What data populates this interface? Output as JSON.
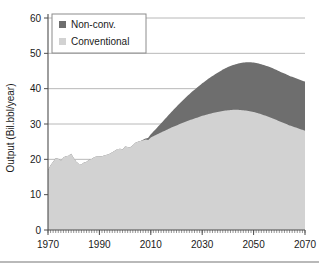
{
  "chart_data": {
    "type": "area",
    "stacked": true,
    "title": "",
    "xlabel": "",
    "ylabel": "Output (Bil.bbl/year)",
    "xlim": [
      1970,
      2070
    ],
    "ylim": [
      0,
      60
    ],
    "xticks": [
      1970,
      1990,
      2010,
      2030,
      2050,
      2070
    ],
    "yticks": [
      0,
      10,
      20,
      30,
      40,
      50,
      60
    ],
    "xtick_labels": [
      "1970",
      "1990",
      "2010",
      "2030",
      "2050",
      "2070"
    ],
    "ytick_labels": [
      "0",
      "10",
      "20",
      "30",
      "40",
      "50",
      "60"
    ],
    "minor_xtick_interval": 1,
    "grid": "horizontal",
    "legend_position": "top-left",
    "colors": {
      "non_conventional": "#6e6e6e",
      "conventional": "#d2d2d2",
      "axis": "#4d4d4d",
      "grid": "#b0b0b0",
      "text": "#1a1a1a",
      "legend_border": "#8c8c8c",
      "background": "#ffffff"
    },
    "series": [
      {
        "name": "Conventional",
        "color_key": "conventional",
        "x": [
          1970,
          1971,
          1972,
          1973,
          1974,
          1975,
          1976,
          1977,
          1978,
          1979,
          1980,
          1981,
          1982,
          1983,
          1984,
          1985,
          1986,
          1987,
          1988,
          1989,
          1990,
          1991,
          1992,
          1993,
          1994,
          1995,
          1996,
          1997,
          1998,
          1999,
          2000,
          2001,
          2002,
          2003,
          2004,
          2005,
          2006,
          2007,
          2008,
          2009,
          2010,
          2012,
          2014,
          2016,
          2018,
          2020,
          2022,
          2024,
          2026,
          2028,
          2030,
          2032,
          2034,
          2036,
          2038,
          2040,
          2042,
          2044,
          2046,
          2048,
          2050,
          2052,
          2054,
          2056,
          2058,
          2060,
          2062,
          2064,
          2066,
          2068,
          2070
        ],
        "values": [
          17.0,
          18.3,
          19.3,
          20.3,
          20.2,
          19.6,
          20.5,
          20.9,
          21.0,
          21.6,
          20.4,
          19.3,
          18.7,
          18.6,
          19.1,
          19.3,
          19.9,
          20.1,
          20.6,
          20.8,
          20.8,
          20.9,
          21.1,
          21.3,
          21.6,
          22.0,
          22.4,
          22.9,
          23.0,
          22.8,
          23.6,
          23.5,
          23.4,
          24.0,
          24.7,
          25.0,
          25.2,
          25.4,
          25.6,
          25.5,
          26.2,
          26.9,
          27.6,
          28.3,
          29.0,
          29.6,
          30.2,
          30.8,
          31.3,
          31.8,
          32.3,
          32.7,
          33.1,
          33.4,
          33.7,
          33.9,
          34.0,
          34.0,
          33.9,
          33.7,
          33.4,
          33.0,
          32.5,
          32.0,
          31.4,
          30.8,
          30.2,
          29.6,
          29.1,
          28.6,
          28.1
        ]
      },
      {
        "name": "Non-conv.",
        "color_key": "non_conventional",
        "x": [
          1970,
          2006,
          2008,
          2010,
          2012,
          2014,
          2016,
          2018,
          2020,
          2022,
          2024,
          2026,
          2028,
          2030,
          2032,
          2034,
          2036,
          2038,
          2040,
          2042,
          2044,
          2046,
          2048,
          2050,
          2052,
          2054,
          2056,
          2058,
          2060,
          2062,
          2064,
          2066,
          2068,
          2070
        ],
        "values": [
          0,
          0,
          0.3,
          0.9,
          1.7,
          2.6,
          3.5,
          4.4,
          5.3,
          6.2,
          7.0,
          7.8,
          8.5,
          9.2,
          9.9,
          10.5,
          11.1,
          11.7,
          12.2,
          12.7,
          13.1,
          13.5,
          13.8,
          14.0,
          14.1,
          14.2,
          14.2,
          14.2,
          14.1,
          14.1,
          14.0,
          14.0,
          13.9,
          13.9
        ]
      }
    ],
    "stack_totals_note": "Total = Conventional + Non-conv.; peaks near 48 around 2050",
    "legend": [
      {
        "label": "Non-conv.",
        "color_key": "non_conventional"
      },
      {
        "label": "Conventional",
        "color_key": "conventional"
      }
    ]
  }
}
